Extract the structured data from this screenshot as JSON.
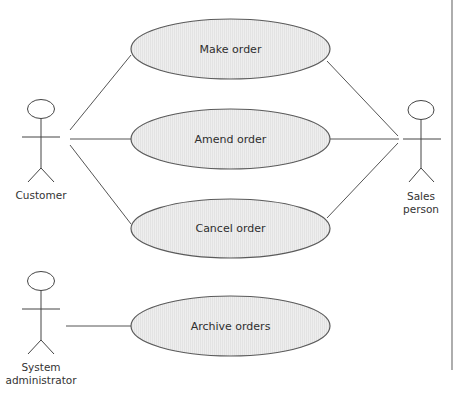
{
  "diagram": {
    "type": "uml-use-case",
    "actors": [
      {
        "id": "customer",
        "label_lines": [
          "Customer"
        ]
      },
      {
        "id": "sales",
        "label_lines": [
          "Sales",
          "person"
        ]
      },
      {
        "id": "sysadmin",
        "label_lines": [
          "System",
          "administrator"
        ]
      }
    ],
    "use_cases": [
      {
        "id": "make",
        "label": "Make order"
      },
      {
        "id": "amend",
        "label": "Amend order"
      },
      {
        "id": "cancel",
        "label": "Cancel order"
      },
      {
        "id": "archive",
        "label": "Archive orders"
      }
    ],
    "associations": [
      [
        "customer",
        "make"
      ],
      [
        "customer",
        "amend"
      ],
      [
        "customer",
        "cancel"
      ],
      [
        "sales",
        "make"
      ],
      [
        "sales",
        "amend"
      ],
      [
        "sales",
        "cancel"
      ],
      [
        "sysadmin",
        "archive"
      ]
    ],
    "colors": {
      "line": "#555555",
      "ellipse_fill": "#ececec",
      "ellipse_stroke": "#5a5a5a",
      "text": "#333333",
      "border": "#777777"
    }
  }
}
